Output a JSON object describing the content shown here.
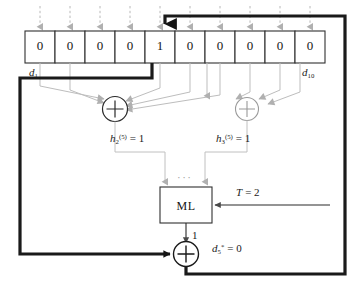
{
  "diagram": {
    "colors": {
      "thick_line": "#1a1a1a",
      "gray_line": "#b3b3b3",
      "cell_border": "#333333",
      "text": "#141414"
    },
    "register": {
      "name": "shift-register",
      "cell_count": 10,
      "cells": [
        {
          "index": 1,
          "value": "0"
        },
        {
          "index": 2,
          "value": "0"
        },
        {
          "index": 3,
          "value": "0"
        },
        {
          "index": 4,
          "value": "0"
        },
        {
          "index": 5,
          "value": "1"
        },
        {
          "index": 6,
          "value": "0"
        },
        {
          "index": 7,
          "value": "0"
        },
        {
          "index": 8,
          "value": "0"
        },
        {
          "index": 9,
          "value": "0"
        },
        {
          "index": 10,
          "value": "0"
        }
      ],
      "left_label": {
        "base": "d",
        "sub": "1"
      },
      "right_label": {
        "base": "d",
        "sub": "10"
      }
    },
    "adders": [
      {
        "name": "adder-h2",
        "symbol": "+"
      },
      {
        "name": "adder-h3",
        "symbol": "+"
      },
      {
        "name": "adder-output",
        "symbol": "+"
      }
    ],
    "syndrome_labels": [
      {
        "base": "h",
        "sub": "2",
        "sup": "(5)",
        "eq": "= 1"
      },
      {
        "base": "h",
        "sub": "3",
        "sup": "(5)",
        "eq": "= 1"
      }
    ],
    "majority_logic": {
      "name": "majority-logic-block",
      "label": "ML",
      "ellipsis": "···",
      "threshold": {
        "base": "T",
        "eq": "= 2"
      },
      "output_value": "1"
    },
    "output": {
      "base": "d",
      "sub": "5",
      "sup": "*",
      "eq": "= 0"
    }
  }
}
